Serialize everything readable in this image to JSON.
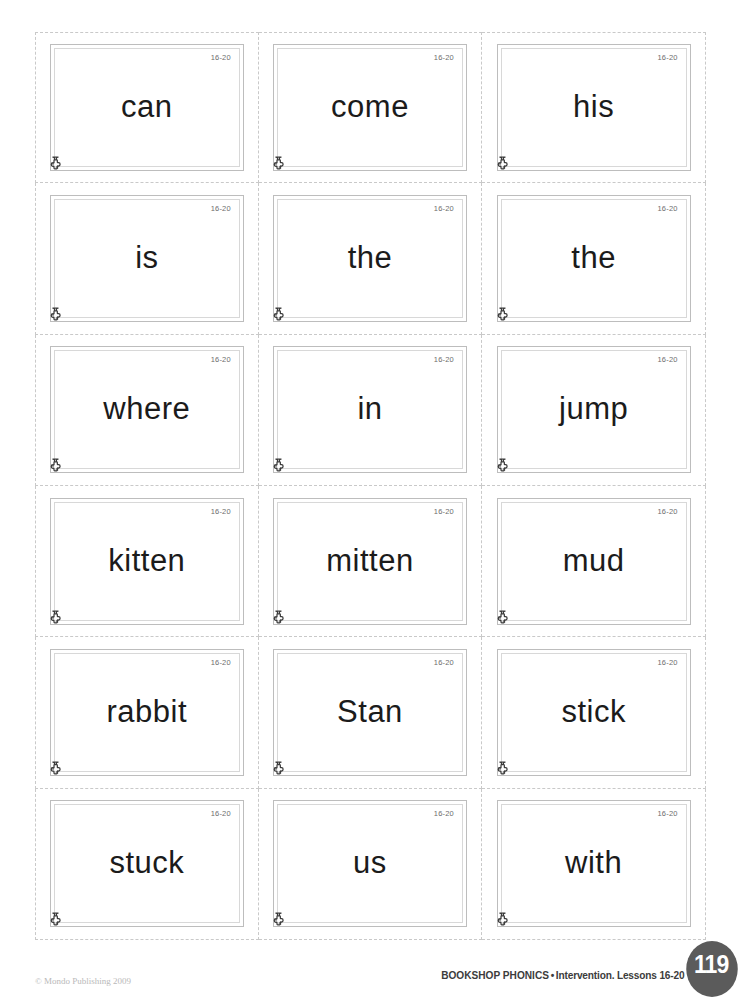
{
  "page": {
    "page_number": "119",
    "copyright": "© Mondo Publishing 2009",
    "credit_series": "BOOKSHOP PHONICS",
    "credit_bullet": "•",
    "credit_detail": "Intervention. Lessons 16-20"
  },
  "colors": {
    "card_border": "#bdbdbd",
    "card_inner_border": "#d8d8d8",
    "cut_line": "#c9c9c9",
    "word_text": "#1b1b1b",
    "tag_text": "#6d6d6d",
    "badge_bg": "#5b5b5b",
    "copyright_text": "#b9b9b9"
  },
  "grid": {
    "columns": 3,
    "rows": 6
  },
  "cards": [
    {
      "word": "can",
      "lesson_tag": "16-20",
      "logo": "puzzle-piece-icon"
    },
    {
      "word": "come",
      "lesson_tag": "16-20",
      "logo": "puzzle-piece-icon"
    },
    {
      "word": "his",
      "lesson_tag": "16-20",
      "logo": "puzzle-piece-icon"
    },
    {
      "word": "is",
      "lesson_tag": "16-20",
      "logo": "puzzle-piece-icon"
    },
    {
      "word": "the",
      "lesson_tag": "16-20",
      "logo": "puzzle-piece-icon"
    },
    {
      "word": "the",
      "lesson_tag": "16-20",
      "logo": "puzzle-piece-icon"
    },
    {
      "word": "where",
      "lesson_tag": "16-20",
      "logo": "puzzle-piece-icon"
    },
    {
      "word": "in",
      "lesson_tag": "16-20",
      "logo": "puzzle-piece-icon"
    },
    {
      "word": "jump",
      "lesson_tag": "16-20",
      "logo": "puzzle-piece-icon"
    },
    {
      "word": "kitten",
      "lesson_tag": "16-20",
      "logo": "puzzle-piece-icon"
    },
    {
      "word": "mitten",
      "lesson_tag": "16-20",
      "logo": "puzzle-piece-icon"
    },
    {
      "word": "mud",
      "lesson_tag": "16-20",
      "logo": "puzzle-piece-icon"
    },
    {
      "word": "rabbit",
      "lesson_tag": "16-20",
      "logo": "puzzle-piece-icon"
    },
    {
      "word": "Stan",
      "lesson_tag": "16-20",
      "logo": "puzzle-piece-icon"
    },
    {
      "word": "stick",
      "lesson_tag": "16-20",
      "logo": "puzzle-piece-icon"
    },
    {
      "word": "stuck",
      "lesson_tag": "16-20",
      "logo": "puzzle-piece-icon"
    },
    {
      "word": "us",
      "lesson_tag": "16-20",
      "logo": "puzzle-piece-icon"
    },
    {
      "word": "with",
      "lesson_tag": "16-20",
      "logo": "puzzle-piece-icon"
    }
  ]
}
